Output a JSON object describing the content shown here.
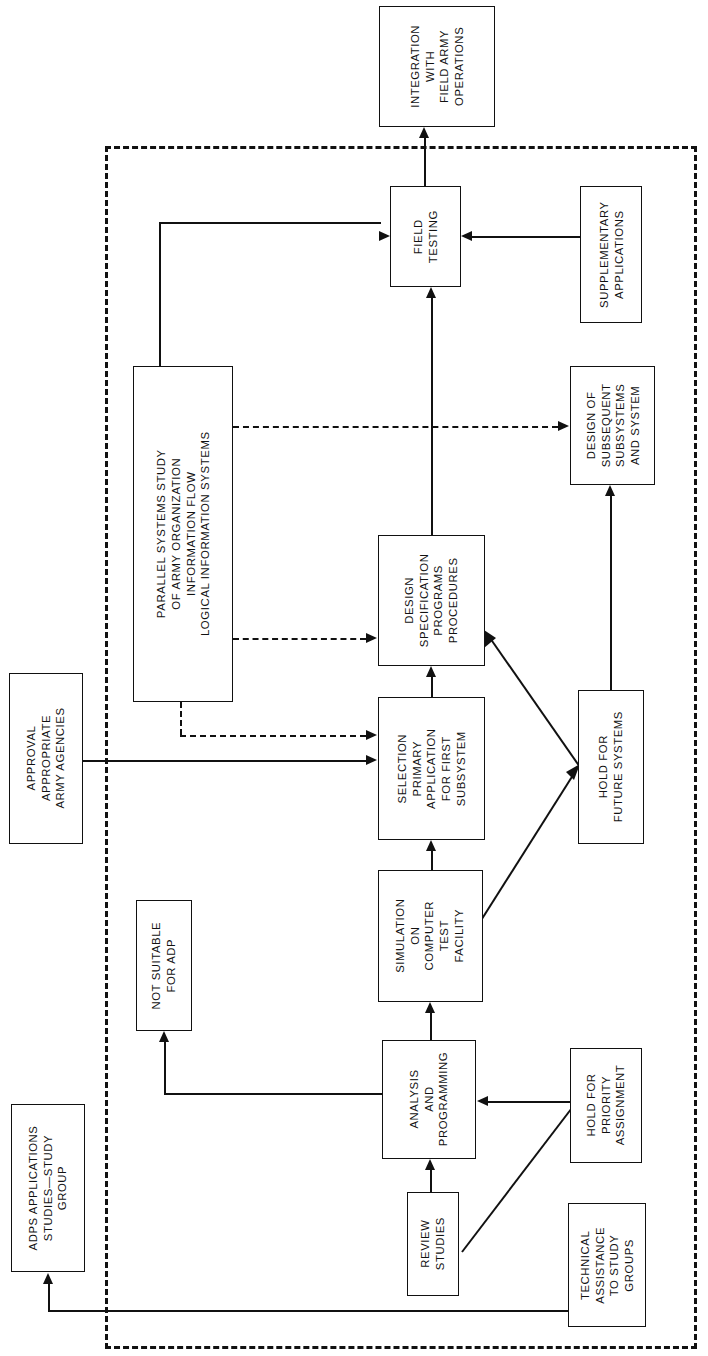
{
  "diagram": {
    "orientation": "rotated-90-ccw",
    "stroke_color": "#111111",
    "background_color": "#ffffff",
    "boundary_style": "dashed"
  },
  "nodes": {
    "integration": {
      "lines": [
        "INTEGRATION",
        "WITH",
        "FIELD ARMY",
        "OPERATIONS"
      ]
    },
    "field_testing": {
      "lines": [
        "FIELD",
        "TESTING"
      ]
    },
    "supplementary": {
      "lines": [
        "SUPPLEMENTARY",
        "APPLICATIONS"
      ]
    },
    "parallel_study": {
      "lines": [
        "PARALLEL  SYSTEMS  STUDY",
        "OF  ARMY  ORGANIZATION",
        "INFORMATION  FLOW",
        "LOGICAL  INFORMATION  SYSTEMS"
      ]
    },
    "design_spec": {
      "lines": [
        "DESIGN",
        "SPECIFICATION",
        "PROGRAMS",
        "PROCEDURES"
      ]
    },
    "design_subsequent": {
      "lines": [
        "DESIGN OF",
        "SUBSEQUENT",
        "SUBSYSTEMS",
        "AND SYSTEM"
      ]
    },
    "selection_primary": {
      "lines": [
        "SELECTION",
        "PRIMARY",
        "APPLICATION",
        "FOR FIRST",
        "SUBSYSTEM"
      ]
    },
    "hold_future": {
      "lines": [
        "HOLD FOR",
        "FUTURE SYSTEMS"
      ]
    },
    "approval": {
      "lines": [
        "APPROVAL",
        "APPROPRIATE",
        "ARMY AGENCIES"
      ]
    },
    "simulation": {
      "lines": [
        "SIMULATION",
        "ON",
        "COMPUTER",
        "TEST",
        "FACILITY"
      ]
    },
    "not_suitable": {
      "lines": [
        "NOT SUITABLE",
        "FOR ADP"
      ]
    },
    "analysis": {
      "lines": [
        "ANALYSIS",
        "AND",
        "PROGRAMMING"
      ]
    },
    "hold_priority": {
      "lines": [
        "HOLD FOR",
        "PRIORITY",
        "ASSIGNMENT"
      ]
    },
    "review_studies": {
      "lines": [
        "REVIEW",
        "STUDIES"
      ]
    },
    "technical_assistance": {
      "lines": [
        "TECHNICAL",
        "ASSISTANCE",
        "TO STUDY",
        "GROUPS"
      ]
    },
    "adps_study_group": {
      "lines": [
        "ADPS  APPLICATIONS",
        "STUDIES—STUDY",
        "GROUP"
      ]
    }
  },
  "edges": [
    {
      "from": "field_testing",
      "to": "integration",
      "style": "solid",
      "arrow": true
    },
    {
      "from": "supplementary",
      "to": "field_testing",
      "style": "solid",
      "arrow": true
    },
    {
      "from": "parallel_study",
      "to": "field_testing",
      "style": "solid",
      "arrow": true
    },
    {
      "from": "parallel_study",
      "to": "design_subsequent",
      "style": "dashed",
      "arrow": true
    },
    {
      "from": "parallel_study",
      "to": "design_spec",
      "style": "dashed",
      "arrow": true
    },
    {
      "from": "parallel_study",
      "to": "selection_primary",
      "style": "dashed",
      "arrow": true
    },
    {
      "from": "design_spec",
      "to": "field_testing",
      "style": "solid",
      "arrow": true
    },
    {
      "from": "selection_primary",
      "to": "design_spec",
      "style": "solid",
      "arrow": true
    },
    {
      "from": "simulation",
      "to": "selection_primary",
      "style": "solid",
      "arrow": true
    },
    {
      "from": "approval",
      "to": "selection_primary",
      "style": "solid",
      "arrow": true
    },
    {
      "from": "hold_future",
      "to": "design_subsequent",
      "style": "solid",
      "arrow": true
    },
    {
      "from": "simulation",
      "to": "hold_future",
      "style": "solid",
      "arrow": true
    },
    {
      "from": "hold_future",
      "to": "design_spec",
      "style": "solid",
      "arrow": true
    },
    {
      "from": "analysis",
      "to": "simulation",
      "style": "solid",
      "arrow": true
    },
    {
      "from": "analysis",
      "to": "not_suitable",
      "style": "solid",
      "arrow": true
    },
    {
      "from": "hold_priority",
      "to": "analysis",
      "style": "solid",
      "arrow": true
    },
    {
      "from": "review_studies",
      "to": "analysis",
      "style": "solid",
      "arrow": true
    },
    {
      "from": "review_studies",
      "to": "hold_priority",
      "style": "solid",
      "arrow": true
    },
    {
      "from": "technical_assistance",
      "to": "adps_study_group",
      "style": "solid",
      "arrow": true
    }
  ]
}
